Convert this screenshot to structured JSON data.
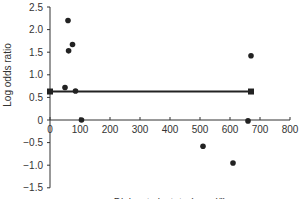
{
  "chart_data": {
    "type": "scatter",
    "title": "",
    "xlabel": "Dialysate lactate (mmol/l)",
    "ylabel": "Log odds ratio",
    "xlim": [
      0,
      800
    ],
    "ylim": [
      -1.5,
      2.5
    ],
    "xticks": [
      "0",
      "100",
      "200",
      "300",
      "400",
      "500",
      "600",
      "700",
      "800"
    ],
    "yticks": [
      "2.5",
      "2.0",
      "1.5",
      "1.0",
      "0.5",
      "0",
      "-0.5",
      "-1.0",
      "-1.5"
    ],
    "grid": false,
    "legend": null,
    "series": [
      {
        "name": "points",
        "type": "scatter",
        "x": [
          60,
          62,
          75,
          50,
          85,
          105,
          510,
          610,
          660,
          670
        ],
        "y": [
          2.2,
          1.53,
          1.67,
          0.72,
          0.64,
          0.0,
          -0.58,
          -0.95,
          -0.02,
          1.42
        ]
      },
      {
        "name": "pooled estimate",
        "type": "line",
        "x": [
          0,
          670
        ],
        "y": [
          0.63,
          0.63
        ]
      }
    ]
  }
}
